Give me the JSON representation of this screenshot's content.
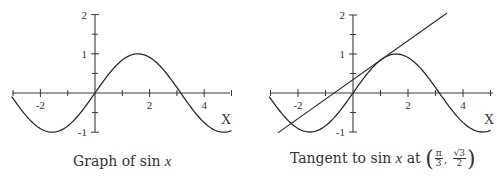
{
  "chart_data": [
    {
      "type": "line",
      "title": "Graph of sin x",
      "caption": {
        "prefix": "Graph of ",
        "func": "sin",
        "var": "x"
      },
      "xlabel": "X",
      "ylabel": "",
      "xlim": [
        -3.05,
        5.0
      ],
      "ylim": [
        -1,
        2
      ],
      "x_ticks": [
        -3,
        -2,
        -1,
        0,
        1,
        2,
        3,
        4,
        5
      ],
      "x_tick_labels": {
        "-2": "-2",
        "2": "2",
        "4": "4"
      },
      "y_ticks": [
        -1,
        -0.5,
        0.5,
        1,
        1.5,
        2
      ],
      "y_tick_labels": {
        "-1": "-1",
        "1": "1",
        "2": "2"
      },
      "grid": false,
      "series": [
        {
          "name": "sin x",
          "function": "sin",
          "domain": [
            -3.05,
            5.0
          ]
        }
      ],
      "layout": {
        "origin_px": [
          95,
          93
        ],
        "unit_x_px": 27.3,
        "unit_y_px": 39.2,
        "axis_x_px": [
          12,
          230
        ]
      }
    },
    {
      "type": "line",
      "title": "Tangent to sin x at (π/3, √3/2)",
      "caption": {
        "prefix": "Tangent to ",
        "func": "sin",
        "var": "x",
        "mid": " at ",
        "point_x_num": "π",
        "point_x_den": "3",
        "point_y_num": "√3",
        "point_y_den": "2"
      },
      "xlabel": "X",
      "ylabel": "",
      "xlim": [
        -3.05,
        5.0
      ],
      "ylim": [
        -1,
        2
      ],
      "x_ticks": [
        -3,
        -2,
        -1,
        0,
        1,
        2,
        3,
        4,
        5
      ],
      "x_tick_labels": {
        "-2": "-2",
        "2": "2",
        "4": "4"
      },
      "y_ticks": [
        -1,
        -0.5,
        0.5,
        1,
        1.5,
        2
      ],
      "y_tick_labels": {
        "-1": "-1",
        "1": "1",
        "2": "2"
      },
      "grid": false,
      "series": [
        {
          "name": "sin x",
          "function": "sin",
          "domain": [
            -3.05,
            5.0
          ]
        },
        {
          "name": "tangent line",
          "function": "tangent",
          "slope": 0.5,
          "point": [
            1.0472,
            0.866
          ],
          "domain": [
            -2.73,
            3.42
          ]
        }
      ],
      "layout": {
        "origin_px": [
          105,
          93
        ],
        "unit_x_px": 27.5,
        "unit_y_px": 39.0,
        "axis_x_px": [
          23,
          245
        ]
      }
    }
  ]
}
